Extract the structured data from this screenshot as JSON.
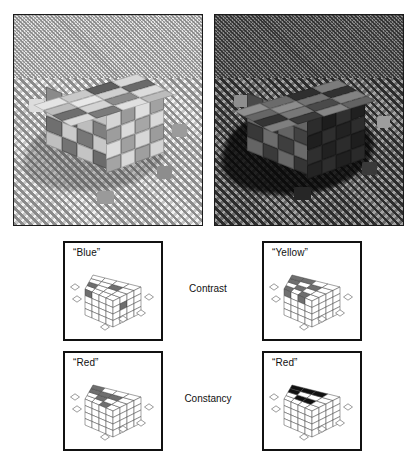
{
  "figure": {
    "type": "illusion-demonstration"
  },
  "photos": [
    {
      "id": "photo-neutral",
      "name": "cube-under-neutral-illumination",
      "scene": "4x4x4 stack of coloured blocks on a fine checkerboard floor, lit from upper left, soft cast shadow to the left, four small loose blocks scattered on the floor",
      "illumination": "neutral / bright",
      "background_tone": "#c6c6c6",
      "border_color": "#1a1a1a"
    },
    {
      "id": "photo-shadow",
      "name": "cube-under-shadowed-illumination",
      "scene": "identical block stack seen from a slightly different angle, plunged into a deep cast shadow, checkerboard floor visible but darkened",
      "illumination": "shadowed / dark",
      "background_tone": "#6a6a6a",
      "border_color": "#1a1a1a"
    }
  ],
  "rows": [
    {
      "id": "row-contrast",
      "label": "Contrast"
    },
    {
      "id": "row-constancy",
      "label": "Constancy"
    }
  ],
  "panels": [
    {
      "id": "panel-blue",
      "label": "“Blue”",
      "row": "Contrast",
      "side": "left",
      "marked_tiles": 4,
      "marked_faces": [
        "top",
        "left",
        "right"
      ],
      "tile_fill": "#6f6f6f"
    },
    {
      "id": "panel-yellow",
      "label": "“Yellow”",
      "row": "Contrast",
      "side": "right",
      "marked_tiles": 9,
      "marked_faces": [
        "top",
        "left"
      ],
      "tile_fill": "#6f6f6f"
    },
    {
      "id": "panel-red-left",
      "label": "“Red”",
      "row": "Constancy",
      "side": "left",
      "marked_tiles": 6,
      "marked_faces": [
        "top",
        "left"
      ],
      "tile_fill": "#6f6f6f"
    },
    {
      "id": "panel-red-right",
      "label": "“Red”",
      "row": "Constancy",
      "side": "right",
      "marked_tiles": 6,
      "marked_faces": [
        "top",
        "left"
      ],
      "tile_fill": "#111111"
    }
  ],
  "colors": {
    "page_background": "#ffffff",
    "panel_border": "#111111",
    "text": "#111111",
    "light_tile_light": "#e9e9e9",
    "light_tile_mid": "#b4b4b4",
    "light_tile_dark": "#707070",
    "dark_tile_light": "#8a8a8a",
    "dark_tile_mid": "#5a5a5a",
    "dark_tile_dark": "#2e2e2e"
  },
  "cube_tiles": {
    "neutral": {
      "top": [
        [
          "#e4e4e4",
          "#c9c9c9",
          "#5e5e5e",
          "#d8d8d8"
        ],
        [
          "#bdbdbd",
          "#e8e8e8",
          "#cfcfcf",
          "#6a6a6a"
        ],
        [
          "#6e6e6e",
          "#d4d4d4",
          "#8b8b8b",
          "#dcdcdc"
        ],
        [
          "#dadada",
          "#7a7a7a",
          "#e0e0e0",
          "#bcbcbc"
        ]
      ],
      "left": [
        [
          "#8a8a8a",
          "#d0d0d0",
          "#747474",
          "#c2c2c2"
        ],
        [
          "#c6c6c6",
          "#6d6d6d",
          "#bdbdbd",
          "#7f7f7f"
        ],
        [
          "#6f6f6f",
          "#cacaca",
          "#777777",
          "#c7c7c7"
        ],
        [
          "#c0c0c0",
          "#737373",
          "#c4c4c4",
          "#6b6b6b"
        ]
      ],
      "right": [
        [
          "#d5d5d5",
          "#9a9a9a",
          "#dfdfdf",
          "#a2a2a2"
        ],
        [
          "#9d9d9d",
          "#dadada",
          "#a6a6a6",
          "#d9d9d9"
        ],
        [
          "#dcdcdc",
          "#a0a0a0",
          "#d7d7d7",
          "#9c9c9c"
        ],
        [
          "#a4a4a4",
          "#d8d8d8",
          "#9f9f9f",
          "#d4d4d4"
        ]
      ]
    },
    "shadowed": {
      "top": [
        [
          "#8f8f8f",
          "#6b6b6b",
          "#2f2f2f",
          "#7c7c7c"
        ],
        [
          "#666666",
          "#8d8d8d",
          "#737373",
          "#313131"
        ],
        [
          "#343434",
          "#787878",
          "#4a4a4a",
          "#828282"
        ],
        [
          "#7f7f7f",
          "#3b3b3b",
          "#868686",
          "#636363"
        ]
      ],
      "left": [
        [
          "#4a4a4a",
          "#6f6f6f",
          "#3a3a3a",
          "#656565"
        ],
        [
          "#6a6a6a",
          "#373737",
          "#636363",
          "#424242"
        ],
        [
          "#383838",
          "#6c6c6c",
          "#3e3e3e",
          "#6a6a6a"
        ],
        [
          "#646464",
          "#3a3a3a",
          "#676767",
          "#353535"
        ]
      ],
      "right": [
        [
          "#2c2c2c",
          "#1d1d1d",
          "#303030",
          "#202020"
        ],
        [
          "#1f1f1f",
          "#2e2e2e",
          "#222222",
          "#2d2d2d"
        ],
        [
          "#2f2f2f",
          "#212121",
          "#2c2c2c",
          "#1e1e1e"
        ],
        [
          "#232323",
          "#2d2d2d",
          "#202020",
          "#2a2a2a"
        ]
      ]
    }
  },
  "floor_chips": {
    "neutral": [
      {
        "x": "8%",
        "y": "40%",
        "w": "8%",
        "h": "6%",
        "bg": "#dddddd"
      },
      {
        "x": "84%",
        "y": "52%",
        "w": "8%",
        "h": "6%",
        "bg": "#9b9b9b"
      },
      {
        "x": "76%",
        "y": "72%",
        "w": "8%",
        "h": "6%",
        "bg": "#8d8d8d"
      },
      {
        "x": "44%",
        "y": "84%",
        "w": "9%",
        "h": "6%",
        "bg": "#9a9a9a"
      }
    ],
    "shadowed": [
      {
        "x": "10%",
        "y": "38%",
        "w": "8%",
        "h": "6%",
        "bg": "#8e8e8e"
      },
      {
        "x": "86%",
        "y": "48%",
        "w": "7%",
        "h": "6%",
        "bg": "#9d9d9d"
      },
      {
        "x": "78%",
        "y": "70%",
        "w": "8%",
        "h": "6%",
        "bg": "#3a3a3a"
      },
      {
        "x": "42%",
        "y": "82%",
        "w": "9%",
        "h": "6%",
        "bg": "#262626"
      }
    ]
  }
}
